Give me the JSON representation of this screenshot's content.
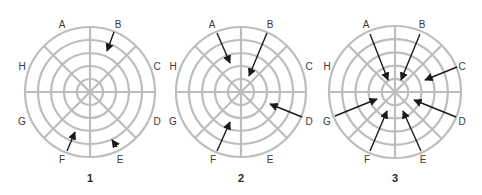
{
  "diagram": {
    "ring_color": "#bdbdbd",
    "arrow_color": "#1a1a1a",
    "label_color": "#3a3a3a",
    "sector_letters": [
      "A",
      "B",
      "C",
      "D",
      "E",
      "F",
      "G",
      "H"
    ],
    "ring_count": 5,
    "spoke_count": 8,
    "panels": [
      {
        "number": "1",
        "center": [
          90,
          92
        ],
        "radius": 65,
        "labels": {
          "A": [
            62,
            25
          ],
          "B": [
            118,
            25
          ],
          "C": [
            157,
            67
          ],
          "D": [
            157,
            122
          ],
          "E": [
            120,
            160
          ],
          "F": [
            62,
            160
          ],
          "G": [
            22,
            122
          ],
          "H": [
            22,
            67
          ]
        },
        "arrows": [
          {
            "sector": "B",
            "from": [
              114,
              32
            ],
            "to": [
              107,
              51
            ]
          },
          {
            "sector": "F",
            "from": [
              67,
              151
            ],
            "to": [
              75,
              132
            ]
          },
          {
            "sector": "E",
            "from": [
              117,
              147
            ],
            "to": [
              112,
              140
            ]
          }
        ]
      },
      {
        "number": "2",
        "center": [
          241,
          92
        ],
        "radius": 65,
        "labels": {
          "A": [
            212,
            25
          ],
          "B": [
            270,
            25
          ],
          "C": [
            309,
            67
          ],
          "D": [
            309,
            122
          ],
          "E": [
            270,
            160
          ],
          "F": [
            213,
            160
          ],
          "G": [
            173,
            122
          ],
          "H": [
            173,
            67
          ]
        },
        "arrows": [
          {
            "sector": "A",
            "from": [
              217,
              33
            ],
            "to": [
              230,
              63
            ]
          },
          {
            "sector": "B",
            "from": [
              267,
              33
            ],
            "to": [
              249,
              76
            ]
          },
          {
            "sector": "D",
            "from": [
              302,
              117
            ],
            "to": [
              270,
              104
            ]
          },
          {
            "sector": "F",
            "from": [
              217,
              151
            ],
            "to": [
              230,
              122
            ]
          }
        ]
      },
      {
        "number": "3",
        "center": [
          395,
          92
        ],
        "radius": 66,
        "labels": {
          "A": [
            366,
            25
          ],
          "B": [
            422,
            25
          ],
          "C": [
            462,
            67
          ],
          "D": [
            462,
            122
          ],
          "E": [
            423,
            160
          ],
          "F": [
            367,
            160
          ],
          "G": [
            327,
            122
          ],
          "H": [
            327,
            67
          ]
        },
        "arrows": [
          {
            "sector": "A",
            "from": [
              370,
              34
            ],
            "to": [
              388,
              80
            ]
          },
          {
            "sector": "B",
            "from": [
              420,
              34
            ],
            "to": [
              401,
              80
            ]
          },
          {
            "sector": "C",
            "from": [
              457,
              67
            ],
            "to": [
              425,
              80
            ]
          },
          {
            "sector": "D",
            "from": [
              456,
              117
            ],
            "to": [
              414,
              100
            ]
          },
          {
            "sector": "E",
            "from": [
              421,
              151
            ],
            "to": [
              403,
              111
            ]
          },
          {
            "sector": "F",
            "from": [
              370,
              151
            ],
            "to": [
              387,
              111
            ]
          },
          {
            "sector": "G",
            "from": [
              335,
              116
            ],
            "to": [
              377,
              99
            ]
          }
        ]
      }
    ],
    "panel_number_y": 179
  }
}
